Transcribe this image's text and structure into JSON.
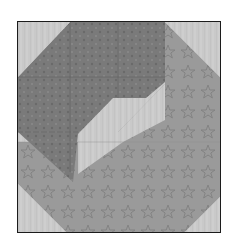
{
  "image": {
    "description": "Quilt block with a dark patterned octagon in the upper-left and a star-print band around the right and bottom, on a light mottled background",
    "colors": {
      "background_light": "#c9c9c9",
      "dark_fabric": "#7a7a7a",
      "dark_fabric_deep": "#5e5e5e",
      "star_fabric": "#9a9a9a",
      "border": "#1c1c1c"
    }
  }
}
